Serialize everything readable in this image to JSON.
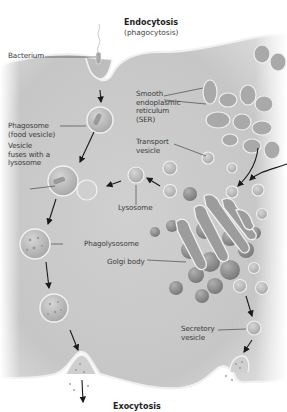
{
  "diagram": {
    "title_top": "Endocytosis",
    "subtitle_top": "(phagocytosis)",
    "title_bottom": "Exocytosis",
    "labels": {
      "bacterium": "Bacterium",
      "phagosome": "Phagosome\n(food vesicle)",
      "vesicle_fuses": "Vesicle\nfuses with a\nlysosome",
      "ser": "Smooth\nendoplasmic\nreticulum\n(SER)",
      "transport_vesicle": "Transport\nvesicle",
      "lysosome": "Lysosome",
      "phagolysosome": "Phagolysosome",
      "golgi_body": "Golgi body",
      "secretory_vesicle": "Secretory\nvesicle"
    },
    "colors": {
      "cytoplasm": "#c9c9c9",
      "membrane": "#f2f2f2",
      "organelle": "#9a9a9a",
      "organelle_dark": "#7d7d7d",
      "vesicle": "#b5b5b5",
      "arrow": "#1a1a1a",
      "leader": "#333333",
      "text": "#3a3a3a"
    }
  }
}
